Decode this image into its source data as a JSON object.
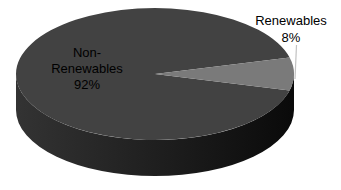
{
  "chart_data": {
    "type": "pie",
    "style": "3d",
    "title": "",
    "categories": [
      "Non-Renewables",
      "Renewables"
    ],
    "values": [
      92,
      8
    ],
    "unit": "%",
    "legend": "none",
    "data_labels": {
      "non_renewables": {
        "lines": [
          "Non-",
          "Renewables",
          "92%"
        ]
      },
      "renewables": {
        "lines": [
          "Renewables",
          "8%"
        ]
      }
    },
    "colors": {
      "non_renewables_top": "#424242",
      "renewables_top": "#7a7a7a",
      "side_left": "#333333",
      "side_mid": "#1d1d1d",
      "side_right": "#0a0a0a",
      "leader_line": "#c2c2c2",
      "label_text": "#000000",
      "background": "#ffffff"
    }
  }
}
